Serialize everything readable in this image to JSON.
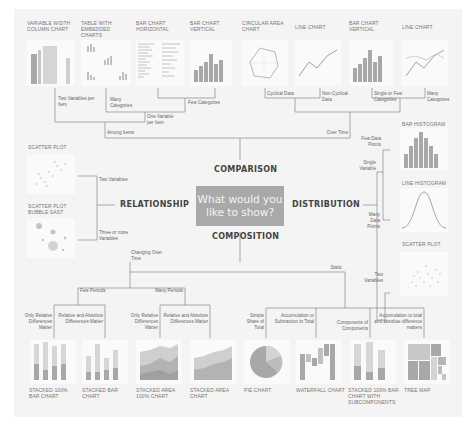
{
  "center": {
    "question": "What would you like to show?"
  },
  "categories": {
    "comparison": "COMPARISON",
    "relationship": "RELATIONSHIP",
    "distribution": "DISTRIBUTION",
    "composition": "COMPOSITION"
  },
  "comparison": {
    "branches": {
      "among_items": "Among Items",
      "over_time": "Over Time"
    },
    "conditions": {
      "two_vars_per_item": "Two Variables per Item",
      "many_categories": "Many Categories",
      "one_var_per_item": "One Variable per Item",
      "few_categories": "Few Categories",
      "cyclical": "Cyclical Data",
      "non_cyclical": "Non-Cyclical Data",
      "single_few": "Single or Few Categories",
      "many_categories_time": "Many Categories"
    },
    "charts": [
      {
        "title": "VARIABLE WIDTH COLUMN CHART"
      },
      {
        "title": "TABLE WITH EMBEDDED CHARTS"
      },
      {
        "title": "BAR CHART HORIZONTAL"
      },
      {
        "title": "BAR CHART VERTICAL"
      },
      {
        "title": "CIRCULAR AREA CHART"
      },
      {
        "title": "LINE CHART"
      },
      {
        "title": "BAR CHART VERTICAL"
      },
      {
        "title": "LINE CHART"
      }
    ]
  },
  "relationship": {
    "conditions": {
      "two": "Two Variables",
      "three": "Three or more Variables"
    },
    "charts": [
      {
        "title": "SCATTER PLOT"
      },
      {
        "title": "SCATTER PLOT BUBBLE SAST"
      }
    ]
  },
  "distribution": {
    "conditions": {
      "single_var": "Single Variable",
      "few_points": "Few Data Points",
      "many_points": "Many Data Points",
      "two_vars": "Two Variables"
    },
    "charts": [
      {
        "title": "BAR HISTOGRAM"
      },
      {
        "title": "LINE HISTOGRAM"
      },
      {
        "title": "SCATTER PLOT"
      }
    ]
  },
  "composition": {
    "branches": {
      "changing": "Changing Over Time",
      "static": "Static",
      "few_periods": "Few Periods",
      "many_periods": "Many Periods"
    },
    "conditions": {
      "few_rel": "Only Relative Differences Matter",
      "few_abs": "Relative and Absolute Differences Matter",
      "many_rel": "Only Relative Differences Matter",
      "many_abs": "Relative and Absolute Differences Matter",
      "simple": "Simple Share of Total",
      "accum": "Accumulation or Subtraction to Total",
      "components": "Components of Components",
      "accum_total": "Accumulation to total and absolute difference matters"
    },
    "charts": [
      {
        "title": "STACKED 100% BAR CHART"
      },
      {
        "title": "STACKED BAR CHART"
      },
      {
        "title": "STACKED AREA 100% CHART"
      },
      {
        "title": "STACKED AREA CHART"
      },
      {
        "title": "PIE CHART"
      },
      {
        "title": "WATERFALL CHART"
      },
      {
        "title": "STACKED 100% BAR CHART WITH SUBCOMPONENTS"
      },
      {
        "title": "TREE MAP"
      }
    ]
  },
  "colors": {
    "background": "#f4f4f4",
    "center_box": "#a9a9a9",
    "chart_gray": "#a6a6a6",
    "line": "#666666"
  }
}
